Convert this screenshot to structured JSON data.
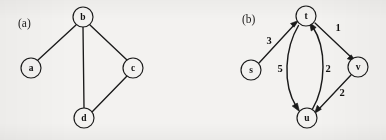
{
  "figure": {
    "width": 386,
    "height": 140,
    "background_color": "#f3f2f0",
    "ink_color": "#1a1a1a",
    "panels": [
      {
        "id": "panel-a",
        "label": "(a)",
        "label_x": 28,
        "label_y": 22,
        "graph_type": "undirected",
        "nodes": [
          {
            "id": "a",
            "label": "a",
            "cx": 31,
            "cy": 68,
            "r": 10
          },
          {
            "id": "b",
            "label": "b",
            "cx": 83,
            "cy": 17,
            "r": 10
          },
          {
            "id": "c",
            "label": "c",
            "cx": 133,
            "cy": 68,
            "r": 10
          },
          {
            "id": "d",
            "label": "d",
            "cx": 84,
            "cy": 118,
            "r": 10
          }
        ],
        "edges": [
          {
            "from": "b",
            "to": "a",
            "weight": ""
          },
          {
            "from": "b",
            "to": "c",
            "weight": ""
          },
          {
            "from": "b",
            "to": "d",
            "weight": ""
          },
          {
            "from": "c",
            "to": "d",
            "weight": ""
          }
        ]
      },
      {
        "id": "panel-b",
        "label": "(b)",
        "label_x": 252,
        "label_y": 18,
        "graph_type": "directed-weighted",
        "nodes": [
          {
            "id": "s",
            "label": "s",
            "cx": 251,
            "cy": 70,
            "r": 10
          },
          {
            "id": "t",
            "label": "t",
            "cx": 306,
            "cy": 16,
            "r": 10
          },
          {
            "id": "u",
            "label": "u",
            "cx": 307,
            "cy": 118,
            "r": 10
          },
          {
            "id": "v",
            "label": "v",
            "cx": 358,
            "cy": 67,
            "r": 10
          }
        ],
        "edges": [
          {
            "from": "s",
            "to": "t",
            "weight": "3",
            "label_x": 269,
            "label_y": 42,
            "shape": "straight"
          },
          {
            "from": "t",
            "to": "v",
            "weight": "1",
            "label_x": 338,
            "label_y": 29,
            "shape": "straight"
          },
          {
            "from": "v",
            "to": "u",
            "weight": "2",
            "label_x": 342,
            "label_y": 94,
            "shape": "straight"
          },
          {
            "from": "t",
            "to": "u",
            "weight": "5",
            "label_x": 280,
            "label_y": 70,
            "shape": "curve-left"
          },
          {
            "from": "u",
            "to": "t",
            "weight": "2",
            "label_x": 328,
            "label_y": 70,
            "shape": "curve-right"
          }
        ]
      }
    ]
  }
}
